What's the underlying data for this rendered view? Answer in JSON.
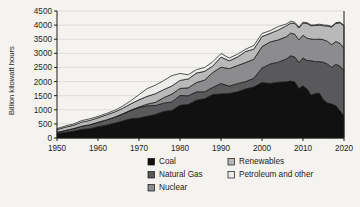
{
  "chart_data": {
    "type": "area",
    "stacked": true,
    "title": "",
    "xlabel": "",
    "ylabel": "Billion kilowatt hours",
    "xlim": [
      1950,
      2020
    ],
    "ylim": [
      0,
      4500
    ],
    "ytick_step": 500,
    "xtick_step": 10,
    "grid": true,
    "legend_position": "bottom",
    "yticks": [
      "0",
      "500",
      "1000",
      "1500",
      "2000",
      "2500",
      "3000",
      "3500",
      "4000",
      "4500"
    ],
    "xticks": [
      "1950",
      "1960",
      "1970",
      "1980",
      "1990",
      "2000",
      "2010",
      "2020"
    ],
    "x": [
      1950,
      1952,
      1954,
      1956,
      1958,
      1960,
      1962,
      1964,
      1966,
      1968,
      1970,
      1972,
      1974,
      1976,
      1978,
      1980,
      1982,
      1984,
      1986,
      1988,
      1990,
      1992,
      1994,
      1996,
      1998,
      2000,
      2002,
      2004,
      2006,
      2007,
      2008,
      2009,
      2010,
      2011,
      2012,
      2013,
      2014,
      2015,
      2016,
      2017,
      2018,
      2019,
      2020
    ],
    "series": [
      {
        "name": "Coal",
        "color": "#111111",
        "values": [
          155,
          195,
          240,
          300,
          330,
          400,
          455,
          520,
          600,
          685,
          705,
          770,
          830,
          940,
          975,
          1160,
          1190,
          1340,
          1390,
          1540,
          1560,
          1575,
          1635,
          1737,
          1807,
          1966,
          1933,
          1978,
          1991,
          2016,
          1986,
          1756,
          1847,
          1733,
          1514,
          1581,
          1582,
          1352,
          1239,
          1206,
          1146,
          966,
          774
        ]
      },
      {
        "name": "Natural Gas",
        "color": "#59595b",
        "values": [
          45,
          70,
          95,
          120,
          140,
          158,
          185,
          215,
          250,
          290,
          373,
          376,
          320,
          295,
          305,
          346,
          305,
          297,
          248,
          253,
          373,
          264,
          291,
          262,
          309,
          518,
          691,
          710,
          816,
          897,
          883,
          921,
          988,
          1013,
          1225,
          1124,
          1126,
          1333,
          1378,
          1296,
          1468,
          1582,
          1617
        ]
      },
      {
        "name": "Nuclear",
        "color": "#8c8c8e",
        "values": [
          0,
          0,
          0,
          0,
          0.5,
          1,
          2,
          3,
          5,
          13,
          22,
          54,
          114,
          191,
          276,
          251,
          283,
          328,
          414,
          527,
          577,
          619,
          640,
          675,
          674,
          754,
          780,
          789,
          787,
          807,
          806,
          799,
          807,
          790,
          769,
          789,
          797,
          797,
          806,
          805,
          807,
          809,
          790
        ]
      },
      {
        "name": "Renewables",
        "color": "#b9b9ba",
        "values": [
          101,
          118,
          115,
          142,
          152,
          158,
          175,
          180,
          197,
          224,
          254,
          277,
          306,
          288,
          287,
          284,
          314,
          336,
          309,
          232,
          358,
          276,
          302,
          391,
          358,
          356,
          304,
          354,
          386,
          352,
          383,
          420,
          428,
          520,
          470,
          491,
          499,
          496,
          546,
          626,
          641,
          728,
          792
        ]
      },
      {
        "name": "Petroleum and other",
        "color": "#ececea",
        "values": [
          34,
          40,
          47,
          54,
          58,
          48,
          50,
          56,
          77,
          108,
          184,
          274,
          301,
          320,
          365,
          246,
          147,
          120,
          137,
          149,
          127,
          101,
          99,
          81,
          129,
          111,
          95,
          121,
          64,
          66,
          46,
          39,
          37,
          30,
          23,
          27,
          30,
          28,
          24,
          21,
          25,
          19,
          18
        ]
      }
    ]
  },
  "legend": {
    "items": [
      {
        "label": "Coal",
        "color": "#111111"
      },
      {
        "label": "Natural Gas",
        "color": "#59595b"
      },
      {
        "label": "Nuclear",
        "color": "#8c8c8e"
      },
      {
        "label": "Renewables",
        "color": "#b9b9ba"
      },
      {
        "label": "Petroleum and other",
        "color": "#ececea"
      }
    ]
  }
}
